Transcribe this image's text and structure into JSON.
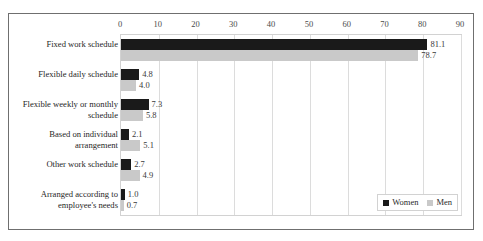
{
  "top_remnant": "",
  "chart_data": {
    "type": "bar",
    "orientation": "horizontal",
    "title": "",
    "subtitle": "",
    "xlabel": "",
    "ylabel": "",
    "xlim": [
      0,
      90
    ],
    "xticks": [
      0,
      10,
      20,
      30,
      40,
      50,
      60,
      70,
      80,
      90
    ],
    "tick_labels": [
      "0",
      "10",
      "20",
      "30",
      "40",
      "50",
      "60",
      "70",
      "80",
      "90"
    ],
    "grid": true,
    "grid_axis": "x",
    "axis_position": "top",
    "legend_position": "bottom-right-inside",
    "categories": [
      "Fixed work schedule",
      "Flexible daily schedule",
      "Flexible weekly or monthly schedule",
      "Based on individual arrangement",
      "Other work schedule",
      "Arranged according to employee's needs"
    ],
    "series": [
      {
        "name": "Women",
        "color": "#1a1a1a",
        "values": [
          81.1,
          4.8,
          7.3,
          2.1,
          2.7,
          1.0
        ],
        "value_labels": [
          "81.1",
          "4.8",
          "7.3",
          "2.1",
          "2.7",
          "1.0"
        ]
      },
      {
        "name": "Men",
        "color": "#c9c9c9",
        "values": [
          78.7,
          4.0,
          5.8,
          5.1,
          4.9,
          0.7
        ],
        "value_labels": [
          "78.7",
          "4.0",
          "5.8",
          "5.1",
          "4.9",
          "0.7"
        ]
      }
    ],
    "legend": [
      "Women",
      "Men"
    ]
  }
}
